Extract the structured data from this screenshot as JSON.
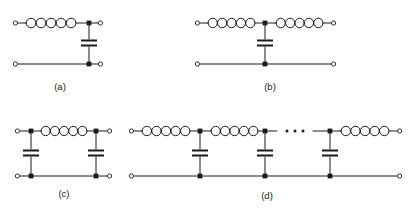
{
  "figure": {
    "width": 411,
    "height": 213,
    "background_color": "#ffffff",
    "line_color": "#1a1a1a"
  },
  "symbols": {
    "inductor": {
      "name": "inductor-coil",
      "loops": 5,
      "description": "series spiral coil"
    },
    "capacitor": {
      "name": "capacitor-plates",
      "plates": 2,
      "description": "shunt parallel-plate capacitor"
    },
    "junction": {
      "name": "junction-node",
      "shape": "filled-square"
    },
    "terminal": {
      "name": "port-terminal",
      "shape": "open-circle"
    },
    "ellipsis": {
      "name": "continuation-ellipsis",
      "dots": 3
    }
  },
  "circuits": [
    {
      "id": "a",
      "label": "(a)",
      "label_x": 60,
      "label_y": 90,
      "topology": "L-section low-pass",
      "series_inductors": 1,
      "shunt_capacitors": 1,
      "geometry": {
        "top_y": 23,
        "bottom_y": 64,
        "left_term_x": 14,
        "right_term_x": 101,
        "node_x": 89,
        "coil_start_x": 26,
        "coil_end_x": 78,
        "cap_y": 43
      }
    },
    {
      "id": "b",
      "label": "(b)",
      "label_x": 270,
      "label_y": 90,
      "topology": "T-section low-pass",
      "series_inductors": 2,
      "shunt_capacitors": 1,
      "geometry": {
        "top_y": 23,
        "bottom_y": 64,
        "left_term_x": 196,
        "right_term_x": 334,
        "node_x": 265,
        "coil1_start_x": 208,
        "coil1_end_x": 255,
        "coil2_start_x": 276,
        "coil2_end_x": 323,
        "cap_y": 43
      }
    },
    {
      "id": "c",
      "label": "(c)",
      "label_x": 64,
      "label_y": 197,
      "topology": "Pi-section low-pass",
      "series_inductors": 1,
      "shunt_capacitors": 2,
      "geometry": {
        "top_y": 131,
        "bottom_y": 176,
        "left_term_x": 16,
        "right_term_x": 110,
        "node1_x": 31,
        "node2_x": 96,
        "coil_start_x": 41,
        "coil_end_x": 87,
        "cap_y": 153
      }
    },
    {
      "id": "d",
      "label": "(d)",
      "label_x": 267,
      "label_y": 199,
      "topology": "Cascaded ladder low-pass",
      "series_inductors": 3,
      "shunt_capacitors": 3,
      "has_ellipsis": true,
      "geometry": {
        "top_y": 131,
        "bottom_y": 176,
        "left_term_x": 130,
        "right_term_x": 400,
        "node1_x": 200,
        "node2_x": 265,
        "node3_x": 330,
        "coil1_start_x": 142,
        "coil1_end_x": 190,
        "coil2_start_x": 211,
        "coil2_end_x": 258,
        "coil3_start_x": 341,
        "coil3_end_x": 389,
        "cap_y": 153,
        "ellipsis_x": 295,
        "ellipsis_y": 131
      }
    }
  ]
}
